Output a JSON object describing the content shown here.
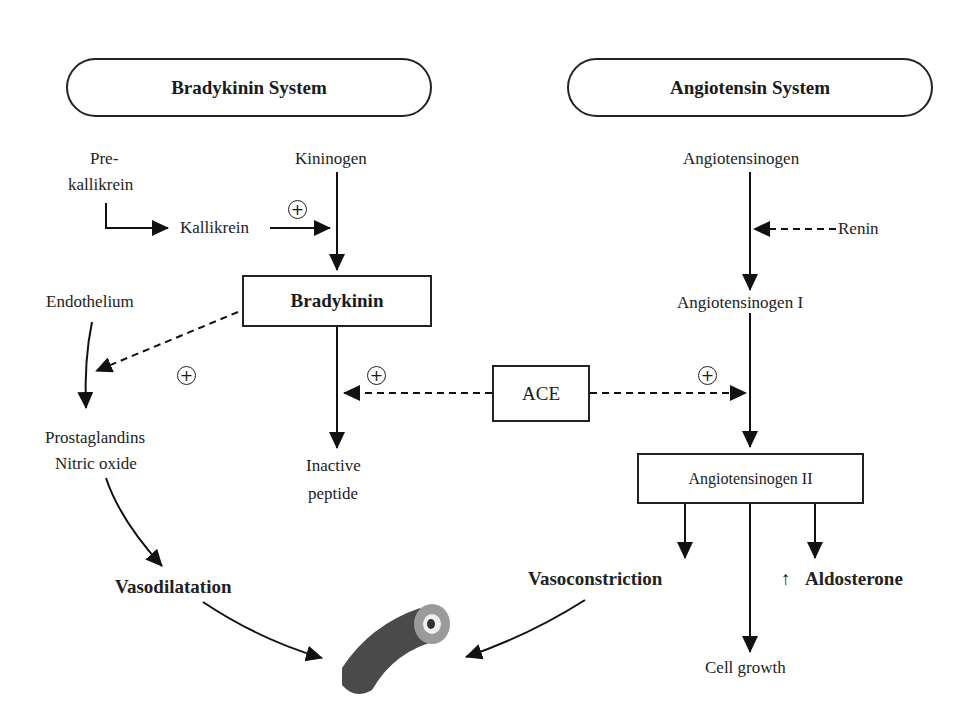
{
  "headers": {
    "left": "Bradykinin System",
    "right": "Angiotensin System"
  },
  "bradykinin_system": {
    "prekallikrein_line1": "Pre-",
    "prekallikrein_line2": "kallikrein",
    "kallikrein": "Kallikrein",
    "kininogen": "Kininogen",
    "bradykinin": "Bradykinin",
    "endothelium": "Endothelium",
    "prostaglandins": "Prostaglandins",
    "nitric_oxide": "Nitric oxide",
    "inactive_line1": "Inactive",
    "inactive_line2": "peptide",
    "vasodilatation": "Vasodilatation"
  },
  "angiotensin_system": {
    "angiotensinogen": "Angiotensinogen",
    "renin": "Renin",
    "angiotensinogen_i": "Angiotensinogen I",
    "angiotensinogen_ii": "Angiotensinogen II",
    "vasoconstriction": "Vasoconstriction",
    "aldosterone_arrow": "↑",
    "aldosterone": "Aldosterone",
    "cell_growth": "Cell growth"
  },
  "ace": "ACE",
  "symbols": {
    "plus": "+"
  },
  "icons": {
    "blood_vessel": "blood-vessel-illustration"
  }
}
